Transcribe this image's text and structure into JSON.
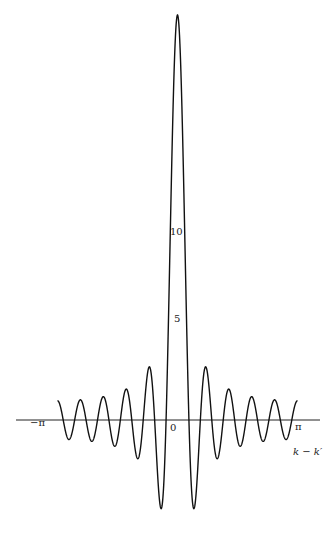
{
  "chart_data": {
    "type": "line",
    "title": "",
    "xlabel": "k − k′",
    "ylabel": "",
    "function": "sin(21x/2)/sin(x/2)",
    "x_range": [
      -3.14159,
      3.14159
    ],
    "ylim": [
      -5,
      21
    ],
    "x_tick_labels": [
      "−π",
      "0",
      "π"
    ],
    "y_tick_labels": [
      "5",
      "10"
    ],
    "y_ticks": [
      5,
      10
    ],
    "peak_value": 21,
    "grid": false,
    "legend": null,
    "series": [
      {
        "name": "Dirichlet kernel (N = 10)",
        "x": [
          -3.14,
          -2.99,
          -2.69,
          -2.39,
          -2.09,
          -1.8,
          -1.5,
          -1.2,
          -0.9,
          -0.6,
          -0.3,
          0,
          0.3,
          0.6,
          0.9,
          1.2,
          1.5,
          1.8,
          2.09,
          2.39,
          2.69,
          2.99,
          3.14
        ],
        "values": [
          -1.0,
          0.0,
          1.0,
          -1.1,
          1.2,
          -1.5,
          1.8,
          -2.3,
          3.0,
          -4.6,
          14.0,
          21.0,
          14.0,
          -4.6,
          3.0,
          -2.3,
          1.8,
          -1.5,
          1.2,
          -1.1,
          1.0,
          0.0,
          -1.0
        ]
      }
    ]
  },
  "labels": {
    "neg_pi": "−π",
    "zero": "0",
    "pi": "π",
    "y5": "5",
    "y10": "10",
    "xlabel_k": "k",
    "xlabel_minus": "−",
    "xlabel_kprime": "k′"
  }
}
